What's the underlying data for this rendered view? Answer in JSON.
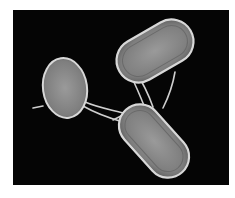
{
  "image": {
    "subject": "micrograph of three rod-shaped bacteria connected by filaments",
    "background_color": "#050505",
    "cell_color": "#8a8a8a",
    "cell_rim_color": "#d8d8d8",
    "cells": [
      {
        "name": "upper-right-cell",
        "cx": 142,
        "cy": 41,
        "rx": 41,
        "ry": 22,
        "rotate": -30
      },
      {
        "name": "left-cell",
        "cx": 52,
        "cy": 78,
        "rx": 22,
        "ry": 30,
        "rotate": -8
      },
      {
        "name": "lower-center-cell",
        "cx": 141,
        "cy": 131,
        "rx": 42,
        "ry": 21,
        "rotate": 48
      }
    ]
  }
}
